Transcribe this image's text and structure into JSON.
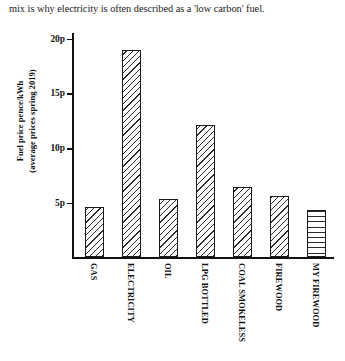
{
  "caption": "mix is why electricity is often described as a 'low carbon' fuel.",
  "chart_data": {
    "type": "bar",
    "title": "",
    "xlabel": "",
    "ylabel": "Fuel price pence/kWh (average prices spring 2019)",
    "ylabel_line1": "Fuel price pence/kWh",
    "ylabel_line2": "(average prices spring 2019)",
    "categories": [
      "GAS",
      "ELECTRICITY",
      "OIL",
      "LPG BOTTLED",
      "COAL SMOKELESS",
      "FIREWOOD",
      "MY FIREWOOD"
    ],
    "values": [
      4.6,
      19.0,
      5.3,
      12.1,
      6.4,
      5.6,
      4.3
    ],
    "value_unit": "p",
    "ylim": [
      0,
      20
    ],
    "yticks": [
      5,
      10,
      15,
      20
    ],
    "ytick_labels": [
      "5p",
      "10p",
      "15p",
      "20p"
    ],
    "grid": false,
    "legend": null,
    "bar_fills": [
      "diagonal-hatch",
      "diagonal-hatch",
      "diagonal-hatch",
      "diagonal-hatch",
      "diagonal-hatch",
      "diagonal-hatch",
      "horizontal-hatch"
    ],
    "colors": {
      "axis": "#111111",
      "bar_outline": "#1a1a1a",
      "bar_hatch": "#2a2a2a",
      "background": "#ffffff"
    }
  }
}
